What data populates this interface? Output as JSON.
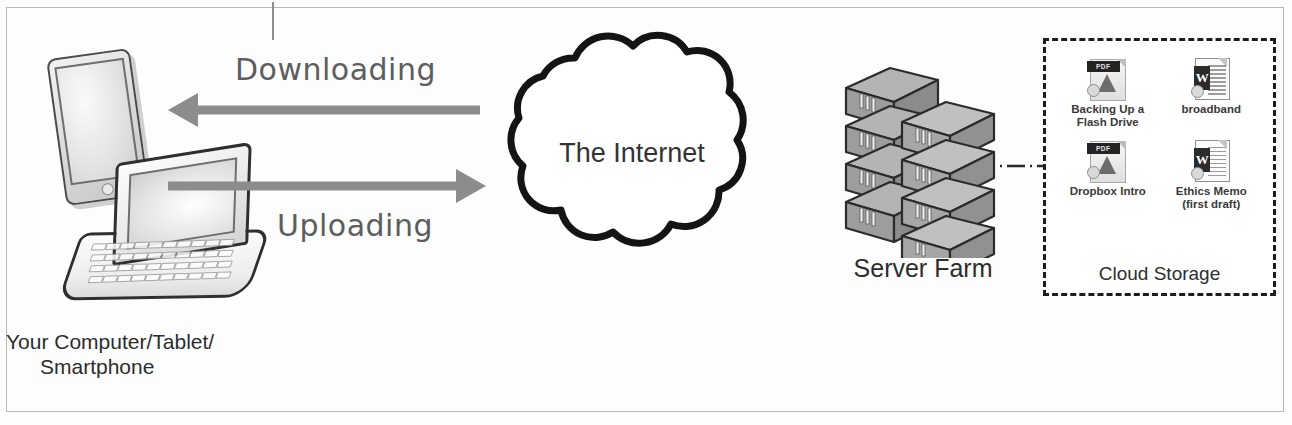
{
  "devices": {
    "tablet_icon": "tablet-device",
    "laptop_icon": "laptop-device",
    "caption_line1": "Your Computer/Tablet/",
    "caption_line2": "Smartphone"
  },
  "arrows": {
    "download": {
      "label": "Downloading",
      "direction": "left",
      "color": "#8c8c8c"
    },
    "upload": {
      "label": "Uploading",
      "direction": "right",
      "color": "#8c8c8c"
    }
  },
  "cloud": {
    "label": "The Internet",
    "outline_color": "#141414"
  },
  "server": {
    "label": "Server Farm",
    "icon": "server-rack-icon"
  },
  "connector": {
    "style": "dash-dot",
    "color": "#2a2a2a"
  },
  "storage": {
    "label": "Cloud Storage",
    "border_style": "dashed",
    "border_color": "#1d1d1d",
    "files": [
      {
        "name": "Backing Up a Flash Drive",
        "type": "pdf",
        "badge": "PDF",
        "icon": "pdf-file-icon"
      },
      {
        "name": "broadband",
        "type": "doc",
        "badge": "W",
        "icon": "word-file-icon"
      },
      {
        "name": "Dropbox Intro",
        "type": "pdf",
        "badge": "PDF",
        "icon": "pdf-file-icon"
      },
      {
        "name": "Ethics Memo (first draft)",
        "type": "doc",
        "badge": "W",
        "icon": "word-file-icon"
      }
    ]
  }
}
